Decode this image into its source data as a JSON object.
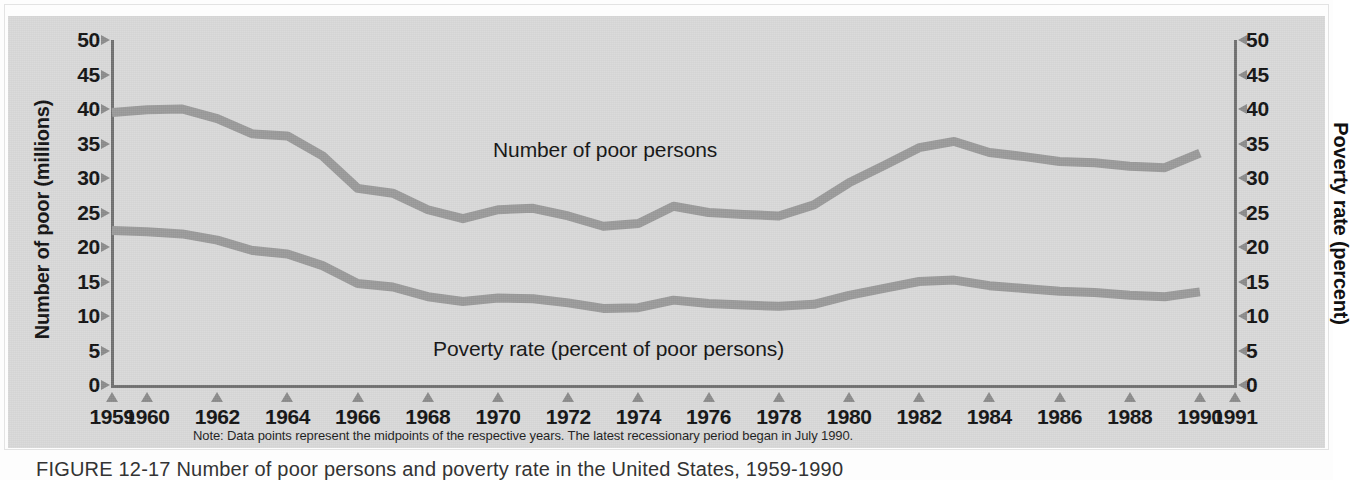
{
  "figure": {
    "caption": "FIGURE 12-17  Number of poor persons and poverty rate in the United States, 1959-1990",
    "note": "Note: Data points represent the midpoints of the respective years. The latest recessionary period began in July 1990."
  },
  "colors": {
    "panel_background": "#d8d8d8",
    "series_line": "#999999",
    "axis": "#6f6f6f",
    "tick_marker": "#8a8a8a",
    "text": "#111111"
  },
  "chart_data": {
    "type": "line",
    "title": "",
    "xlabel": "",
    "ylabel": "Number of poor (millions)",
    "y2label": "Poverty rate (percent)",
    "ylim": [
      0,
      50
    ],
    "y2lim": [
      0,
      50
    ],
    "yticks": [
      0,
      5,
      10,
      15,
      20,
      25,
      30,
      35,
      40,
      45,
      50
    ],
    "y2ticks": [
      0,
      5,
      10,
      15,
      20,
      25,
      30,
      35,
      40,
      45,
      50
    ],
    "xlim": [
      1959,
      1991
    ],
    "xticks": [
      1959,
      1960,
      1962,
      1964,
      1966,
      1968,
      1970,
      1972,
      1974,
      1976,
      1978,
      1980,
      1982,
      1984,
      1986,
      1988,
      1990,
      1991
    ],
    "xticklabels": [
      "1959",
      "1960",
      "1962",
      "1964",
      "1966",
      "1968",
      "1970",
      "1972",
      "1974",
      "1976",
      "1978",
      "1980",
      "1982",
      "1984",
      "1986",
      "1988",
      "1990",
      "1991"
    ],
    "grid": false,
    "legend_position": "inline-annotation",
    "x": [
      1959,
      1960,
      1961,
      1962,
      1963,
      1964,
      1965,
      1966,
      1967,
      1968,
      1969,
      1970,
      1971,
      1972,
      1973,
      1974,
      1975,
      1976,
      1977,
      1978,
      1979,
      1980,
      1981,
      1982,
      1983,
      1984,
      1985,
      1986,
      1987,
      1988,
      1989,
      1990
    ],
    "series": [
      {
        "name": "Number of poor persons",
        "axis": "left",
        "units": "millions",
        "annotation": "Number of poor persons",
        "values": [
          39.5,
          39.9,
          40.0,
          38.6,
          36.4,
          36.1,
          33.2,
          28.5,
          27.8,
          25.4,
          24.1,
          25.4,
          25.6,
          24.5,
          23.0,
          23.4,
          25.9,
          25.0,
          24.7,
          24.5,
          26.1,
          29.3,
          31.8,
          34.4,
          35.3,
          33.7,
          33.1,
          32.4,
          32.2,
          31.7,
          31.5,
          33.6
        ]
      },
      {
        "name": "Poverty rate (percent of poor persons)",
        "axis": "right",
        "units": "percent",
        "annotation": "Poverty rate (percent of poor persons)",
        "values": [
          22.4,
          22.2,
          21.9,
          21.0,
          19.5,
          19.0,
          17.3,
          14.7,
          14.2,
          12.8,
          12.1,
          12.6,
          12.5,
          11.9,
          11.1,
          11.2,
          12.3,
          11.8,
          11.6,
          11.4,
          11.7,
          13.0,
          14.0,
          15.0,
          15.2,
          14.4,
          14.0,
          13.6,
          13.4,
          13.0,
          12.8,
          13.5
        ]
      }
    ]
  }
}
